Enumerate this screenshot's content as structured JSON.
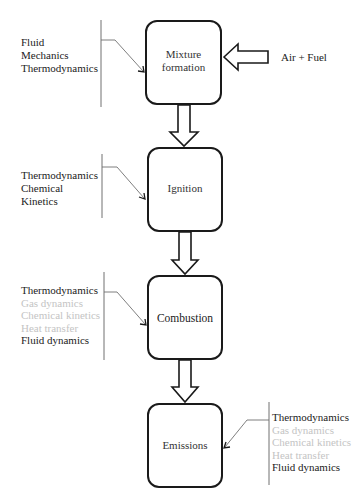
{
  "diagram": {
    "title": "",
    "stages": [
      {
        "id": "mixture",
        "lines": [
          "Mixture",
          "formation"
        ]
      },
      {
        "id": "ignition",
        "lines": [
          "Ignition"
        ]
      },
      {
        "id": "combustion",
        "lines": [
          "Combustion"
        ]
      },
      {
        "id": "emissions",
        "lines": [
          "Emissions"
        ]
      }
    ],
    "input": {
      "label": "Air + Fuel",
      "target": "mixture"
    },
    "flows": [
      {
        "from": "mixture",
        "to": "ignition"
      },
      {
        "from": "ignition",
        "to": "combustion"
      },
      {
        "from": "combustion",
        "to": "emissions"
      }
    ],
    "annotations": [
      {
        "stage": "mixture",
        "side": "left",
        "items": [
          {
            "text": "Fluid",
            "emphasis": "dark"
          },
          {
            "text": "Mechanics",
            "emphasis": "dark"
          },
          {
            "text": "Thermodynamics",
            "emphasis": "dark"
          }
        ]
      },
      {
        "stage": "ignition",
        "side": "left",
        "items": [
          {
            "text": "Thermodynamics",
            "emphasis": "dark"
          },
          {
            "text": "Chemical",
            "emphasis": "dark"
          },
          {
            "text": "Kinetics",
            "emphasis": "dark"
          }
        ]
      },
      {
        "stage": "combustion",
        "side": "left",
        "items": [
          {
            "text": "Thermodynamics",
            "emphasis": "dark"
          },
          {
            "text": "Gas dynamics",
            "emphasis": "light"
          },
          {
            "text": "Chemical kinetics",
            "emphasis": "light"
          },
          {
            "text": "Heat transfer",
            "emphasis": "light"
          },
          {
            "text": "Fluid dynamics",
            "emphasis": "dark"
          }
        ]
      },
      {
        "stage": "emissions",
        "side": "right",
        "items": [
          {
            "text": "Thermodynamics",
            "emphasis": "dark"
          },
          {
            "text": "Gas dynamics",
            "emphasis": "light"
          },
          {
            "text": "Chemical kinetics",
            "emphasis": "light"
          },
          {
            "text": "Heat transfer",
            "emphasis": "light"
          },
          {
            "text": "Fluid dynamics",
            "emphasis": "dark"
          }
        ]
      }
    ],
    "colors": {
      "dark_text": "#222222",
      "light_text": "#c4c4c4",
      "stroke": "#1a1a1a",
      "connector": "#707070"
    }
  }
}
